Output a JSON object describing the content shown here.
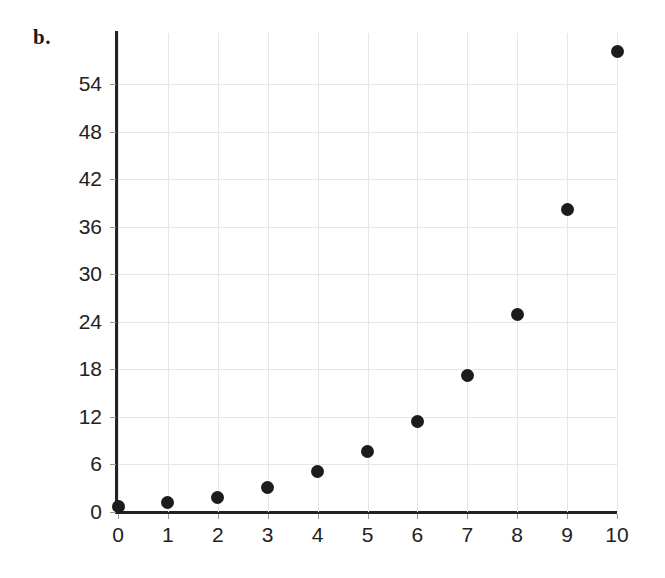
{
  "figure": {
    "panel_label": "b.",
    "background_color": "#ffffff",
    "axis_color": "#222222",
    "grid_color": "#e6e6e6",
    "point_color": "#1c1c1c"
  },
  "chart_data": {
    "type": "scatter",
    "title": "",
    "xlabel": "",
    "ylabel": "",
    "xlim": [
      0,
      10
    ],
    "ylim": [
      0,
      60.5
    ],
    "grid": true,
    "legend": null,
    "x_ticks": [
      0,
      1,
      2,
      3,
      4,
      5,
      6,
      7,
      8,
      9,
      10
    ],
    "x_tick_labels": [
      "0",
      "1",
      "2",
      "3",
      "4",
      "5",
      "6",
      "7",
      "8",
      "9",
      "10"
    ],
    "y_ticks": [
      0,
      6,
      12,
      18,
      24,
      30,
      36,
      42,
      48,
      54
    ],
    "y_tick_labels": [
      "0",
      "6",
      "12",
      "18",
      "24",
      "30",
      "36",
      "42",
      "48",
      "54"
    ],
    "series": [
      {
        "name": "series-1",
        "marker": "circle",
        "color": "#1c1c1c",
        "x": [
          0,
          1,
          2,
          3,
          4,
          5,
          6,
          7,
          8,
          9,
          10
        ],
        "y": [
          0.7,
          1.2,
          1.8,
          3.1,
          5.1,
          7.7,
          11.4,
          17.3,
          25.0,
          38.2,
          58.2
        ],
        "points": [
          {
            "x": 0,
            "y": 0.7
          },
          {
            "x": 1,
            "y": 1.2
          },
          {
            "x": 2,
            "y": 1.8
          },
          {
            "x": 3,
            "y": 3.1
          },
          {
            "x": 4,
            "y": 5.1
          },
          {
            "x": 5,
            "y": 7.7
          },
          {
            "x": 6,
            "y": 11.4
          },
          {
            "x": 7,
            "y": 17.3
          },
          {
            "x": 8,
            "y": 25.0
          },
          {
            "x": 9,
            "y": 38.2
          },
          {
            "x": 10,
            "y": 58.2
          }
        ]
      }
    ]
  }
}
